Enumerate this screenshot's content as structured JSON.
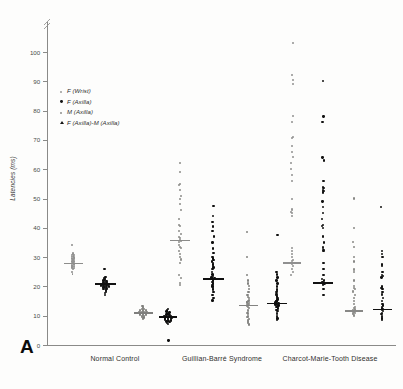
{
  "panel": {
    "label": "A"
  },
  "axes": {
    "y_title": "Latencies (ms)",
    "y_ticks": [
      0,
      10,
      20,
      30,
      40,
      50,
      60,
      70,
      80,
      90,
      100
    ],
    "y_tick_labels": [
      "0",
      "10",
      "20",
      "30",
      "40",
      "50",
      "60",
      "70",
      "80",
      "90",
      "100"
    ],
    "y_min": 0,
    "y_max": 106,
    "axis_break": true
  },
  "legend": {
    "items": [
      {
        "label": "F (Wrist)",
        "marker": "small-dot",
        "color": "#9a9a98"
      },
      {
        "label": "F (Axilla)",
        "marker": "filled-dot",
        "color": "#151515"
      },
      {
        "label": "M (Axilla)",
        "marker": "small-dot",
        "color": "#8e8e8c"
      },
      {
        "label": "F (Axilla)-M (Axilla)",
        "marker": "triangle",
        "color": "#141414"
      }
    ]
  },
  "groups": [
    {
      "label": "Normal Control",
      "center_x": 115
    },
    {
      "label": "Guillian-Barré Syndrome",
      "center_x": 222
    },
    {
      "label": "Charcot-Marie-Tooth Disease",
      "center_x": 330
    }
  ],
  "chart_data": {
    "type": "scatter",
    "title": "",
    "xlabel": "",
    "ylabel": "Latencies (ms)",
    "ylim": [
      0,
      106
    ],
    "grid": false,
    "legend_position": "upper-left",
    "x_categories": [
      "Normal Control",
      "Guillian-Barré Syndrome",
      "Charcot-Marie-Tooth Disease"
    ],
    "series_names": [
      "F (Wrist)",
      "F (Axilla)",
      "M (Axilla)",
      "F (Axilla)-M (Axilla)"
    ],
    "clusters": [
      {
        "group": "Normal Control",
        "series": "F (Wrist)",
        "x_px": 73,
        "color": "#8d8d8b",
        "size": 1.9,
        "mean": 28.0,
        "mean_bar_width": 19,
        "values": [
          34.0,
          31.5,
          31.0,
          30.8,
          30.6,
          30.4,
          30.2,
          30.0,
          29.8,
          29.6,
          29.4,
          29.2,
          29.0,
          28.8,
          28.6,
          28.4,
          28.2,
          28.0,
          27.8,
          27.6,
          27.4,
          27.2,
          27.0,
          26.8,
          26.6,
          26.4,
          26.2,
          26.0,
          25.0,
          24.2
        ]
      },
      {
        "group": "Normal Control",
        "series": "F (Axilla)",
        "x_px": 105,
        "color": "#121212",
        "size": 2.3,
        "mean": 21.0,
        "mean_bar_width": 21,
        "values": [
          26.0,
          23.2,
          22.9,
          22.6,
          22.3,
          22.0,
          21.8,
          21.6,
          21.4,
          21.2,
          21.0,
          20.9,
          20.8,
          20.7,
          20.6,
          20.5,
          20.4,
          20.3,
          20.2,
          20.1,
          20.0,
          19.8,
          19.6,
          19.4,
          19.2,
          19.0,
          18.6,
          18.2,
          17.8,
          17.0
        ]
      },
      {
        "group": "Normal Control",
        "series": "M (Axilla)",
        "x_px": 143,
        "color": "#7f7f7d",
        "size": 2.1,
        "mean": 11.2,
        "mean_bar_width": 19,
        "values": [
          13.4,
          13.0,
          12.7,
          12.4,
          12.2,
          12.0,
          11.9,
          11.8,
          11.7,
          11.6,
          11.5,
          11.4,
          11.3,
          11.2,
          11.1,
          11.0,
          10.9,
          10.8,
          10.7,
          10.6,
          10.5,
          10.4,
          10.3,
          10.2,
          10.0,
          9.8,
          9.6,
          9.4,
          9.2,
          9.0
        ]
      },
      {
        "group": "Normal Control",
        "series": "F (Axilla)-M (Axilla)",
        "x_px": 168,
        "color": "#0f0f0f",
        "size": 2.3,
        "mean": 9.8,
        "mean_bar_width": 18,
        "values": [
          12.3,
          11.8,
          11.4,
          11.1,
          10.8,
          10.6,
          10.4,
          10.2,
          10.0,
          9.9,
          9.8,
          9.7,
          9.6,
          9.5,
          9.4,
          9.3,
          9.2,
          9.1,
          9.0,
          8.9,
          8.8,
          8.7,
          8.6,
          8.4,
          8.2,
          8.0,
          7.8,
          7.5,
          7.2,
          1.5
        ]
      },
      {
        "group": "Guillian-Barré Syndrome",
        "series": "F (Wrist)",
        "x_px": 180,
        "color": "#8b8b89",
        "size": 2.0,
        "mean": 36.0,
        "mean_bar_width": 20,
        "values": [
          62.0,
          59.0,
          55.0,
          54.5,
          53.0,
          51.0,
          50.0,
          48.0,
          46.0,
          43.0,
          41.0,
          40.5,
          39.0,
          38.0,
          37.0,
          36.5,
          36.0,
          35.5,
          35.0,
          34.0,
          33.5,
          33.0,
          32.0,
          31.0,
          30.0,
          29.5,
          29.0,
          28.0,
          24.0,
          23.0,
          21.0,
          20.5
        ]
      },
      {
        "group": "Guillian-Barré Syndrome",
        "series": "F (Axilla)",
        "x_px": 213,
        "color": "#0f0f0f",
        "size": 2.4,
        "mean": 22.8,
        "mean_bar_width": 21,
        "values": [
          47.5,
          44.0,
          42.0,
          40.5,
          39.0,
          37.0,
          35.0,
          33.0,
          31.5,
          30.0,
          29.5,
          29.0,
          28.5,
          28.0,
          27.5,
          27.0,
          26.5,
          26.0,
          25.0,
          24.0,
          23.5,
          23.0,
          22.8,
          22.5,
          22.0,
          21.5,
          21.0,
          20.5,
          20.0,
          19.5,
          19.0,
          18.0,
          17.0,
          16.0,
          15.2
        ]
      },
      {
        "group": "Guillian-Barré Syndrome",
        "series": "M (Axilla)",
        "x_px": 248,
        "color": "#838381",
        "size": 2.1,
        "mean": 13.8,
        "mean_bar_width": 19,
        "values": [
          38.5,
          30.0,
          24.0,
          22.0,
          21.0,
          20.0,
          19.0,
          18.0,
          17.0,
          16.5,
          16.0,
          15.5,
          15.0,
          14.8,
          14.5,
          14.2,
          14.0,
          13.8,
          13.5,
          13.2,
          13.0,
          12.5,
          12.0,
          11.5,
          11.0,
          10.5,
          10.0,
          9.5,
          9.0,
          8.6,
          8.2,
          7.8,
          7.4,
          7.0
        ]
      },
      {
        "group": "Guillian-Barré Syndrome",
        "series": "F (Axilla)-M (Axilla)",
        "x_px": 277,
        "color": "#101010",
        "size": 2.4,
        "mean": 14.5,
        "mean_bar_width": 20,
        "values": [
          37.5,
          25.0,
          24.0,
          23.0,
          22.0,
          21.0,
          20.0,
          19.0,
          18.5,
          18.0,
          17.5,
          17.0,
          16.5,
          16.0,
          15.5,
          15.0,
          14.8,
          14.5,
          14.2,
          14.0,
          13.8,
          13.5,
          13.2,
          13.0,
          12.5,
          12.0,
          11.5,
          11.0,
          10.5,
          10.0,
          9.5,
          9.0,
          8.6
        ]
      },
      {
        "group": "Charcot-Marie-Tooth Disease",
        "series": "F (Wrist)",
        "x_px": 292,
        "color": "#909090",
        "size": 2.0,
        "mean": 28.2,
        "mean_bar_width": 18,
        "values": [
          103.0,
          92.0,
          90.5,
          89.0,
          78.0,
          76.0,
          71.0,
          70.5,
          68.0,
          66.0,
          64.0,
          62.0,
          60.0,
          58.0,
          56.0,
          50.0,
          46.5,
          46.0,
          45.5,
          45.0,
          44.0,
          33.0,
          32.0,
          31.0,
          30.0,
          29.0,
          28.5,
          28.0,
          27.5,
          27.0,
          26.0,
          25.0,
          24.0
        ]
      },
      {
        "group": "Charcot-Marie-Tooth Disease",
        "series": "F (Axilla)",
        "x_px": 323,
        "color": "#121212",
        "size": 2.3,
        "mean": 21.4,
        "mean_bar_width": 20,
        "values": [
          90.0,
          78.0,
          76.0,
          64.0,
          63.0,
          56.0,
          54.0,
          53.5,
          53.0,
          52.5,
          52.0,
          49.0,
          47.0,
          45.0,
          43.0,
          41.0,
          40.5,
          40.0,
          37.0,
          35.0,
          33.5,
          33.0,
          32.5,
          32.0,
          28.0,
          26.0,
          24.0,
          22.5,
          22.0,
          21.5,
          21.2,
          21.0,
          20.8,
          20.5,
          19.0,
          17.0
        ]
      },
      {
        "group": "Charcot-Marie-Tooth Disease",
        "series": "M (Axilla)",
        "x_px": 354,
        "color": "#888886",
        "size": 2.1,
        "mean": 11.8,
        "mean_bar_width": 18,
        "values": [
          50.0,
          40.0,
          35.0,
          33.5,
          30.0,
          28.5,
          26.0,
          25.5,
          25.0,
          22.0,
          20.0,
          19.5,
          19.0,
          18.5,
          18.0,
          17.0,
          16.0,
          15.0,
          14.0,
          13.0,
          12.5,
          12.2,
          12.0,
          11.8,
          11.5,
          11.2,
          11.0,
          10.8,
          10.5,
          10.2,
          10.0
        ]
      },
      {
        "group": "Charcot-Marie-Tooth Disease",
        "series": "F (Axilla)-M (Axilla)",
        "x_px": 382,
        "color": "#111111",
        "size": 2.3,
        "mean": 12.3,
        "mean_bar_width": 19,
        "values": [
          47.0,
          32.0,
          31.0,
          30.0,
          27.5,
          27.0,
          25.0,
          24.0,
          23.5,
          23.0,
          20.0,
          19.5,
          19.0,
          18.0,
          17.5,
          17.0,
          16.0,
          15.0,
          14.0,
          13.5,
          13.0,
          12.5,
          12.3,
          12.0,
          11.5,
          11.0,
          10.5,
          10.0,
          9.5,
          9.0,
          8.5
        ]
      }
    ]
  }
}
